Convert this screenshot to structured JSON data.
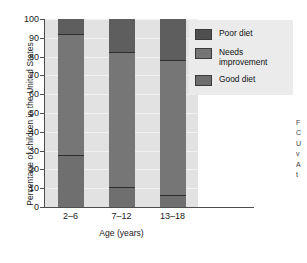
{
  "chart_data": {
    "type": "bar",
    "subtype": "stacked-bar-100",
    "title": "",
    "xlabel": "Age (years)",
    "ylabel": "Percentage of children in the United States",
    "categories": [
      "2–6",
      "7–12",
      "13–18"
    ],
    "ylim": [
      0,
      100
    ],
    "yticks": [
      0,
      10,
      20,
      30,
      40,
      50,
      60,
      70,
      80,
      90,
      100
    ],
    "ytick_labels": [
      "0",
      "10",
      "20",
      "30",
      "40",
      "50",
      "60",
      "70",
      "80",
      "90",
      "100"
    ],
    "grid": true,
    "legend_position": "upper-right-inside",
    "series": [
      {
        "name": "Poor diet",
        "values": [
          8.0,
          17.5,
          22.0
        ],
        "color": "#5e5e5e"
      },
      {
        "name": "Needs improvement",
        "values": [
          64.5,
          72.0,
          71.5
        ],
        "color": "#767676"
      },
      {
        "name": "Good diet",
        "values": [
          27.5,
          10.5,
          6.5
        ],
        "color": "#6f6f6f"
      }
    ],
    "stack_boundaries": {
      "good_top": [
        27.5,
        10.5,
        6.5
      ],
      "needs_top": [
        92.0,
        82.5,
        78.0
      ]
    }
  },
  "legend": {
    "items": [
      {
        "label": "Poor diet"
      },
      {
        "label": "Needs improvement"
      },
      {
        "label": "Good diet"
      }
    ]
  },
  "caption_sliver": {
    "lines": [
      "F",
      "C",
      "U",
      "v",
      "A",
      "t"
    ]
  }
}
